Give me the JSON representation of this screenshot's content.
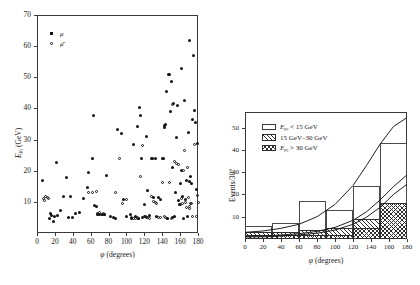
{
  "figure": {
    "panels": [
      "scatter",
      "histogram"
    ]
  },
  "chart_data": [
    {
      "type": "scatter",
      "panel": "left",
      "title": "",
      "xlabel": "φ (degrees)",
      "ylabel": "Eμ2 (GeV)",
      "xlim": [
        0,
        180
      ],
      "ylim": [
        0,
        70
      ],
      "xticks": [
        0,
        20,
        40,
        60,
        80,
        100,
        120,
        140,
        160,
        180
      ],
      "yticks": [
        10,
        20,
        30,
        40,
        50,
        60,
        70
      ],
      "grid": false,
      "legend_position": "top-left",
      "series": [
        {
          "name": "μ",
          "marker": "filled-circle",
          "points": [
            [
              6,
              17.0
            ],
            [
              14,
              4.5
            ],
            [
              15,
              6.3
            ],
            [
              16,
              5.6
            ],
            [
              18,
              3.8
            ],
            [
              20,
              5.2
            ],
            [
              22,
              22.6
            ],
            [
              23,
              5.6
            ],
            [
              26,
              7.2
            ],
            [
              30,
              11.6
            ],
            [
              33,
              17.8
            ],
            [
              35,
              4.9
            ],
            [
              38,
              11.6
            ],
            [
              40,
              5.0
            ],
            [
              43,
              6.3
            ],
            [
              48,
              6.6
            ],
            [
              52,
              11.0
            ],
            [
              56,
              14.6
            ],
            [
              58,
              19.3
            ],
            [
              62,
              23.8
            ],
            [
              63,
              37.6
            ],
            [
              64,
              8.9
            ],
            [
              66,
              8.4
            ],
            [
              68,
              6.0
            ],
            [
              70,
              5.9
            ],
            [
              73,
              6.1
            ],
            [
              76,
              6.0
            ],
            [
              78,
              18.4
            ],
            [
              82,
              5.2
            ],
            [
              86,
              5.0
            ],
            [
              88,
              4.5
            ],
            [
              90,
              33.2
            ],
            [
              94,
              32.0
            ],
            [
              97,
              10.9
            ],
            [
              100,
              5.3
            ],
            [
              104,
              6.1
            ],
            [
              106,
              4.6
            ],
            [
              108,
              28.4
            ],
            [
              110,
              5.2
            ],
            [
              112,
              34.3
            ],
            [
              114,
              4.6
            ],
            [
              115,
              40.4
            ],
            [
              116,
              37.6
            ],
            [
              117,
              23.9
            ],
            [
              118,
              5.0
            ],
            [
              120,
              9.0
            ],
            [
              121,
              5.4
            ],
            [
              122,
              31.0
            ],
            [
              124,
              13.8
            ],
            [
              126,
              5.6
            ],
            [
              128,
              23.9
            ],
            [
              129,
              23.9
            ],
            [
              130,
              11.3
            ],
            [
              132,
              24.0
            ],
            [
              134,
              5.4
            ],
            [
              136,
              11.5
            ],
            [
              138,
              10.8
            ],
            [
              140,
              24.0
            ],
            [
              141,
              23.9
            ],
            [
              142,
              34.0
            ],
            [
              143,
              34.5
            ],
            [
              144,
              35.0
            ],
            [
              145,
              45.4
            ],
            [
              146,
              4.8
            ],
            [
              147,
              50.9
            ],
            [
              148,
              51.0
            ],
            [
              149,
              39.0
            ],
            [
              150,
              48.6
            ],
            [
              151,
              20.9
            ],
            [
              152,
              5.0
            ],
            [
              153,
              41.5
            ],
            [
              154,
              5.4
            ],
            [
              155,
              13.0
            ],
            [
              156,
              30.8
            ],
            [
              157,
              41.0
            ],
            [
              158,
              10.5
            ],
            [
              159,
              9.0
            ],
            [
              160,
              16.0
            ],
            [
              161,
              52.8
            ],
            [
              162,
              20.0
            ],
            [
              163,
              11.6
            ],
            [
              164,
              4.5
            ],
            [
              165,
              42.6
            ],
            [
              166,
              10.6
            ],
            [
              167,
              17.0
            ],
            [
              168,
              5.2
            ],
            [
              169,
              32.4
            ],
            [
              170,
              61.8
            ],
            [
              171,
              16.6
            ],
            [
              172,
              18.0
            ],
            [
              173,
              15.8
            ],
            [
              174,
              36.5
            ],
            [
              175,
              57.0
            ],
            [
              176,
              39.4
            ],
            [
              177,
              35.6
            ],
            [
              178,
              14.0
            ],
            [
              179,
              28.6
            ]
          ]
        },
        {
          "name": "μ̄",
          "marker": "open-circle",
          "points": [
            [
              7,
              11.0
            ],
            [
              8,
              10.5
            ],
            [
              9,
              11.6
            ],
            [
              12,
              11.5
            ],
            [
              13,
              11.0
            ],
            [
              58,
              13.0
            ],
            [
              62,
              12.9
            ],
            [
              66,
              13.2
            ],
            [
              68,
              6.3
            ],
            [
              70,
              6.6
            ],
            [
              72,
              6.0
            ],
            [
              74,
              6.4
            ],
            [
              76,
              6.1
            ],
            [
              88,
              12.9
            ],
            [
              92,
              23.9
            ],
            [
              96,
              9.5
            ],
            [
              100,
              10.8
            ],
            [
              106,
              5.0
            ],
            [
              108,
              4.7
            ],
            [
              110,
              4.6
            ],
            [
              112,
              5.0
            ],
            [
              114,
              4.7
            ],
            [
              116,
              18.2
            ],
            [
              118,
              28.1
            ],
            [
              120,
              5.2
            ],
            [
              122,
              4.9
            ],
            [
              124,
              4.9
            ],
            [
              126,
              4.6
            ],
            [
              128,
              11.8
            ],
            [
              130,
              10.0
            ],
            [
              132,
              9.8
            ],
            [
              134,
              9.6
            ],
            [
              136,
              5.0
            ],
            [
              138,
              5.1
            ],
            [
              140,
              16.2
            ],
            [
              142,
              5.2
            ],
            [
              144,
              4.9
            ],
            [
              146,
              4.7
            ],
            [
              148,
              16.3
            ],
            [
              150,
              4.8
            ],
            [
              152,
              41.4
            ],
            [
              154,
              23.1
            ],
            [
              156,
              22.4
            ],
            [
              158,
              21.9
            ],
            [
              160,
              9.3
            ],
            [
              162,
              11.0
            ],
            [
              163,
              9.6
            ],
            [
              164,
              20.0
            ],
            [
              165,
              26.5
            ],
            [
              166,
              9.8
            ],
            [
              167,
              8.2
            ],
            [
              168,
              21.0
            ],
            [
              169,
              11.5
            ],
            [
              170,
              8.6
            ],
            [
              171,
              7.8
            ],
            [
              172,
              9.6
            ],
            [
              173,
              9.4
            ],
            [
              174,
              5.4
            ],
            [
              176,
              28.3
            ],
            [
              178,
              5.3
            ],
            [
              179,
              11.9
            ],
            [
              180,
              9.8
            ]
          ]
        }
      ]
    },
    {
      "type": "bar",
      "panel": "right",
      "title": "",
      "xlabel": "φ (degrees)",
      "ylabel": "Events/30°",
      "xlim": [
        0,
        180
      ],
      "ylim": [
        0,
        57
      ],
      "xticks": [
        0,
        20,
        40,
        60,
        80,
        100,
        120,
        140,
        160,
        180
      ],
      "yticks": [
        10,
        20,
        30,
        40,
        50
      ],
      "grid": false,
      "legend_position": "top-left",
      "bin_width": 30,
      "bin_edges": [
        0,
        30,
        60,
        90,
        120,
        150,
        180
      ],
      "series": [
        {
          "name": "Eμ2 < 15 GeV",
          "style": "open",
          "values": [
            6,
            7,
            17,
            13,
            24,
            43
          ]
        },
        {
          "name": "15 GeV–30 GeV",
          "style": "hatch-single",
          "values": [
            3,
            3,
            4,
            5,
            9,
            16
          ]
        },
        {
          "name": "Eμ2 > 30 GeV",
          "style": "hatch-cross",
          "values": [
            2,
            2,
            2,
            2,
            5,
            16
          ]
        }
      ],
      "curves": [
        {
          "name": "upper-fit",
          "points": [
            [
              0,
              3.0
            ],
            [
              20,
              3.6
            ],
            [
              40,
              4.8
            ],
            [
              60,
              6.6
            ],
            [
              80,
              10.0
            ],
            [
              100,
              15.5
            ],
            [
              120,
              24.0
            ],
            [
              135,
              33.0
            ],
            [
              150,
              42.5
            ],
            [
              165,
              50.5
            ],
            [
              180,
              54.5
            ]
          ]
        },
        {
          "name": "middle-fit",
          "points": [
            [
              0,
              1.2
            ],
            [
              20,
              1.4
            ],
            [
              40,
              1.8
            ],
            [
              60,
              2.4
            ],
            [
              80,
              3.4
            ],
            [
              100,
              5.2
            ],
            [
              120,
              8.4
            ],
            [
              135,
              12.2
            ],
            [
              150,
              17.5
            ],
            [
              165,
              23.5
            ],
            [
              180,
              28.8
            ]
          ]
        },
        {
          "name": "lower-fit",
          "points": [
            [
              0,
              0.9
            ],
            [
              20,
              1.0
            ],
            [
              40,
              1.3
            ],
            [
              60,
              1.8
            ],
            [
              80,
              2.6
            ],
            [
              100,
              4.0
            ],
            [
              120,
              6.6
            ],
            [
              135,
              9.8
            ],
            [
              150,
              14.2
            ],
            [
              165,
              20.0
            ],
            [
              180,
              24.6
            ]
          ]
        }
      ]
    }
  ],
  "left_panel": {
    "ylabel_main": "E",
    "ylabel_sub": "μ",
    "ylabel_sub2": "2",
    "ylabel_units": "(GeV)",
    "xlabel": "φ (degrees)",
    "xticks": [
      "0",
      "20",
      "40",
      "60",
      "80",
      "100",
      "120",
      "140",
      "160",
      "180"
    ],
    "yticks": [
      "10",
      "20",
      "30",
      "40",
      "50",
      "60",
      "70"
    ],
    "legend": [
      {
        "symbol": "filled-square",
        "label": "μ"
      },
      {
        "symbol": "open-circle",
        "label": "μ̄"
      }
    ]
  },
  "right_panel": {
    "ylabel": "Events/30°",
    "xlabel": "φ (degrees)",
    "xticks": [
      "0",
      "20",
      "40",
      "60",
      "80",
      "100",
      "120",
      "140",
      "160",
      "180"
    ],
    "yticks": [
      "10",
      "20",
      "30",
      "40",
      "50"
    ],
    "legend": [
      {
        "swatch": "open",
        "label_pre": "E",
        "label_sub": "μ",
        "label_sub2": "2",
        "label_post": " < 15 GeV"
      },
      {
        "swatch": "hatch-single",
        "label_pre": "",
        "label_sub": "",
        "label_sub2": "",
        "label_post": "15 GeV–30 GeV"
      },
      {
        "swatch": "hatch-cross",
        "label_pre": "E",
        "label_sub": "μ",
        "label_sub2": "2",
        "label_post": " > 30 GeV"
      }
    ]
  }
}
